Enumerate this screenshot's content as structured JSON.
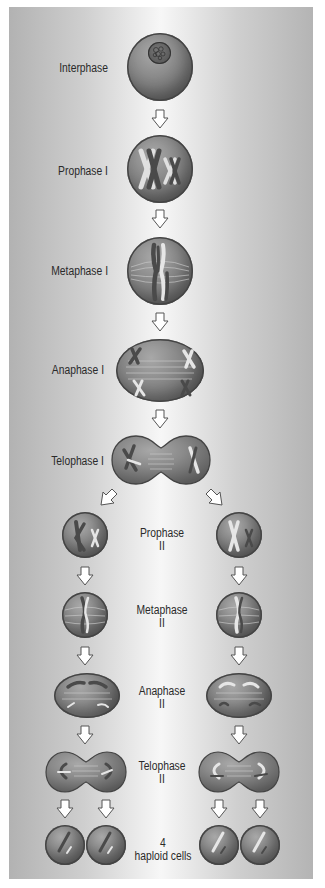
{
  "diagram": {
    "type": "process-flow",
    "colors": {
      "cell_fill": "#8c8c8c",
      "cell_outline": "#444444",
      "chromosome_dark": "#4a4a4a",
      "chromosome_light": "#e8e8e8",
      "arrow_fill": "#ffffff",
      "arrow_outline": "#555555",
      "label_text": "#2a2a2a",
      "background_edge": "#b2b2b2",
      "background_center": "#f7f7f7"
    },
    "stages": [
      {
        "id": "interphase",
        "label": "Interphase"
      },
      {
        "id": "prophase-1",
        "label": "Prophase I"
      },
      {
        "id": "metaphase-1",
        "label": "Metaphase I"
      },
      {
        "id": "anaphase-1",
        "label": "Anaphase I"
      },
      {
        "id": "telophase-1",
        "label": "Telophase I"
      },
      {
        "id": "prophase-2",
        "label_line1": "Prophase",
        "label_line2": "II"
      },
      {
        "id": "metaphase-2",
        "label_line1": "Metaphase",
        "label_line2": "II"
      },
      {
        "id": "anaphase-2",
        "label_line1": "Anaphase",
        "label_line2": "II"
      },
      {
        "id": "telophase-2",
        "label_line1": "Telophase",
        "label_line2": "II"
      },
      {
        "id": "result",
        "label_line1": "4",
        "label_line2": "haploid cells"
      }
    ],
    "icons": {
      "arrow": "down-arrow-icon",
      "cell": "cell-circle"
    }
  }
}
